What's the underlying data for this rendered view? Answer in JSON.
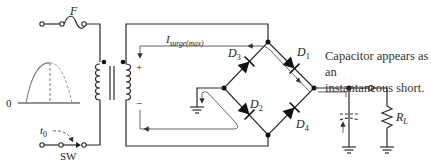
{
  "labels": {
    "fuse": "F",
    "switch": "SW",
    "switch_time": "t",
    "switch_time_sub": "0",
    "zero": "0",
    "surge_current": "I",
    "surge_current_sub": "surge(max)",
    "plus": "+",
    "minus": "−",
    "d1": "D",
    "d1_sub": "1",
    "d2": "D",
    "d2_sub": "2",
    "d3": "D",
    "d3_sub": "3",
    "d4": "D",
    "d4_sub": "4",
    "load": "R",
    "load_sub": "L"
  },
  "caption": {
    "line1": "Capacitor appears as an",
    "line2": "instantaneous short."
  },
  "colors": {
    "wire": "#2a2a2a",
    "current_path": "#555555",
    "waveform": "#777777",
    "background": "#ffffff"
  }
}
